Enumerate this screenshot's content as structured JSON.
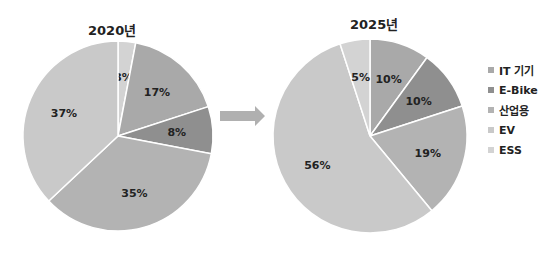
{
  "chart_data": [
    {
      "type": "pie",
      "title": "2020년",
      "categories": [
        "IT 기기",
        "E-Bike",
        "산업용",
        "EV",
        "ESS"
      ],
      "values": [
        17,
        8,
        35,
        37,
        3
      ],
      "slice_order_clockwise_from_top": [
        "ESS",
        "IT 기기",
        "E-Bike",
        "산업용",
        "EV"
      ]
    },
    {
      "type": "pie",
      "title": "2025년",
      "categories": [
        "IT 기기",
        "E-Bike",
        "산업용",
        "EV",
        "ESS"
      ],
      "values": [
        10,
        10,
        19,
        56,
        5
      ],
      "slice_order_clockwise_from_top": [
        "IT 기기",
        "E-Bike",
        "산업용",
        "EV",
        "ESS"
      ]
    }
  ],
  "legend": [
    {
      "label": "IT 기기",
      "color": "#a9a9a9"
    },
    {
      "label": "E-Bike",
      "color": "#8f8f8f"
    },
    {
      "label": "산업용",
      "color": "#b3b3b3"
    },
    {
      "label": "EV",
      "color": "#c9c9c9"
    },
    {
      "label": "ESS",
      "color": "#d3d3d3"
    }
  ],
  "titles": {
    "left": "2020년",
    "right": "2025년"
  }
}
